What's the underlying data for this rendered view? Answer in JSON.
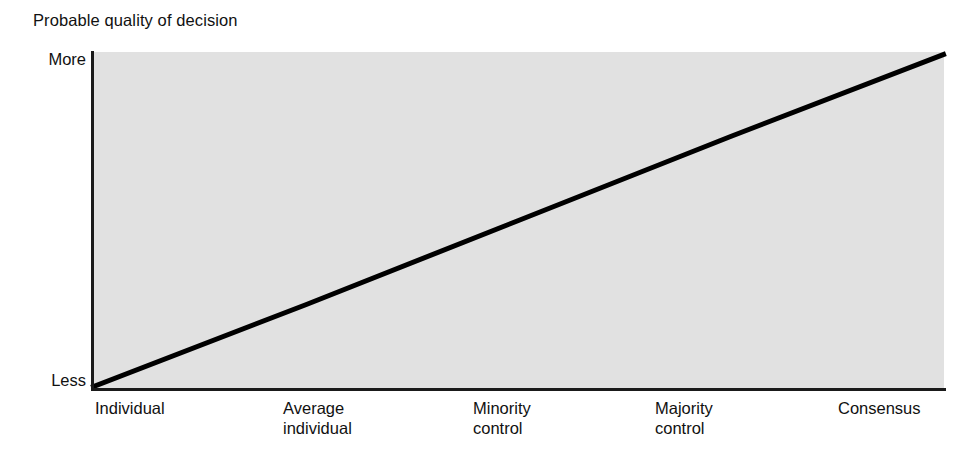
{
  "chart_data": {
    "type": "line",
    "title": "Probable quality of decision",
    "xlabel": "",
    "ylabel": "Probable quality of decision",
    "grid": false,
    "legend": "none",
    "y_axis": {
      "tick_labels": [
        "Less",
        "More"
      ],
      "low_label": "Less",
      "high_label": "More",
      "ylim": [
        0,
        1
      ]
    },
    "x_axis": {
      "categories": [
        "Individual",
        "Average individual",
        "Minority control",
        "Majority control",
        "Consensus"
      ],
      "tick_labels_multiline": [
        [
          "Individual"
        ],
        [
          "Average",
          "individual"
        ],
        [
          "Minority",
          "control"
        ],
        [
          "Majority",
          "control"
        ],
        [
          "Consensus"
        ]
      ]
    },
    "series": [
      {
        "name": "Probable quality of decision",
        "x": [
          "Individual",
          "Average individual",
          "Minority control",
          "Majority control",
          "Consensus"
        ],
        "values": [
          0,
          0.25,
          0.5,
          0.75,
          1.0
        ],
        "line_color": "#000000",
        "line_width": 5
      }
    ],
    "plot_background": "#e1e1e1",
    "axis_color": "#1a1a1a",
    "annotations": []
  },
  "chart": {
    "title": "Probable quality of decision",
    "y_more_label": "More",
    "y_less_label": "Less",
    "x_ticks": [
      {
        "line1": "Individual",
        "line2": ""
      },
      {
        "line1": "Average",
        "line2": "individual"
      },
      {
        "line1": "Minority",
        "line2": "control"
      },
      {
        "line1": "Majority",
        "line2": "control"
      },
      {
        "line1": "Consensus",
        "line2": ""
      }
    ]
  }
}
